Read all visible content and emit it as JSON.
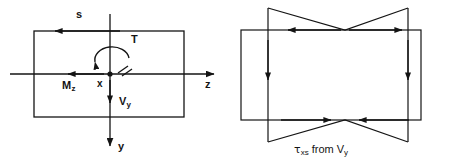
{
  "figure": {
    "type": "engineering-diagram",
    "panels": [
      {
        "id": "left",
        "name": "cross-section-resultants",
        "labels": {
          "s_coordinate": "s",
          "torque": "T",
          "bending_moment": "M",
          "bending_moment_sub": "z",
          "shear_force": "V",
          "shear_force_sub": "y",
          "origin_axis": "x",
          "horizontal_axis": "z",
          "vertical_axis": "y"
        }
      },
      {
        "id": "right",
        "name": "shear-flow-distribution",
        "caption": {
          "tau": "τ",
          "tau_sub": "xs",
          "middle": "from",
          "force": "V",
          "force_sub": "y",
          "full": "τxs from Vy"
        }
      }
    ],
    "colors": {
      "ink": "#141414",
      "background": "#ffffff"
    }
  }
}
